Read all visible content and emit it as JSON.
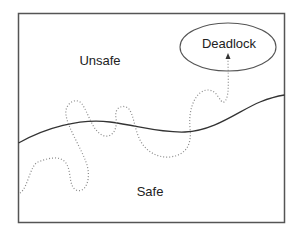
{
  "diagram": {
    "regions": {
      "unsafe_label": "Unsafe",
      "safe_label": "Safe"
    },
    "goal_state": {
      "label": "Deadlock"
    },
    "colors": {
      "frame": "#555555",
      "boundary": "#333333",
      "trajectory": "#888888",
      "text": "#222222",
      "background": "#ffffff"
    }
  }
}
